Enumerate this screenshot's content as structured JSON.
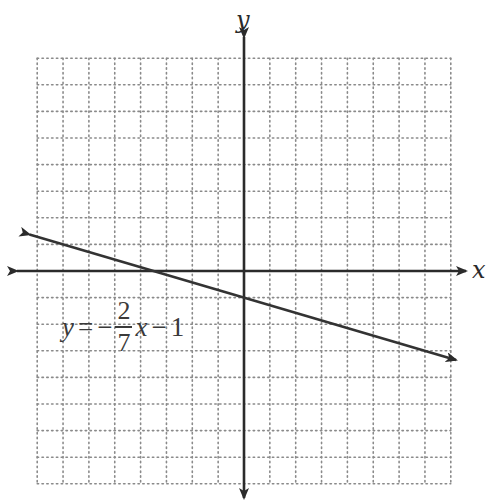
{
  "chart_data": {
    "type": "line",
    "title": "",
    "xlabel": "x",
    "ylabel": "y",
    "xlim": [
      -8,
      8
    ],
    "ylim": [
      -8,
      8
    ],
    "grid": true,
    "grid_style": "dotted",
    "grid_step": 1,
    "tick_labels": [],
    "legend": null,
    "series": [
      {
        "name": "y = -2/7 x - 1",
        "slope": -0.2857142857,
        "intercept": -1,
        "x": [
          -8.3,
          -3.5,
          0,
          8.2
        ],
        "y": [
          1.371,
          0,
          -1,
          -3.343
        ],
        "arrows_both_ends": true
      }
    ],
    "annotations": [
      {
        "text": "y = -2/7 x - 1",
        "position": "lower-left, below line near x=-7 to x=-1, y=-3"
      }
    ],
    "key_points": {
      "x_intercept": [
        -3.5,
        0
      ],
      "y_intercept": [
        0,
        -1
      ]
    }
  },
  "labels": {
    "x_axis": "x",
    "y_axis": "y"
  },
  "equation": {
    "lhs": "y",
    "equals": "=",
    "sign": "−",
    "numerator": "2",
    "denominator": "7",
    "variable": "x",
    "op": "−",
    "constant": "1"
  },
  "colors": {
    "axis": "#2b2b2b",
    "line": "#333333",
    "grid": "#8a8a8a",
    "background": "#ffffff"
  }
}
